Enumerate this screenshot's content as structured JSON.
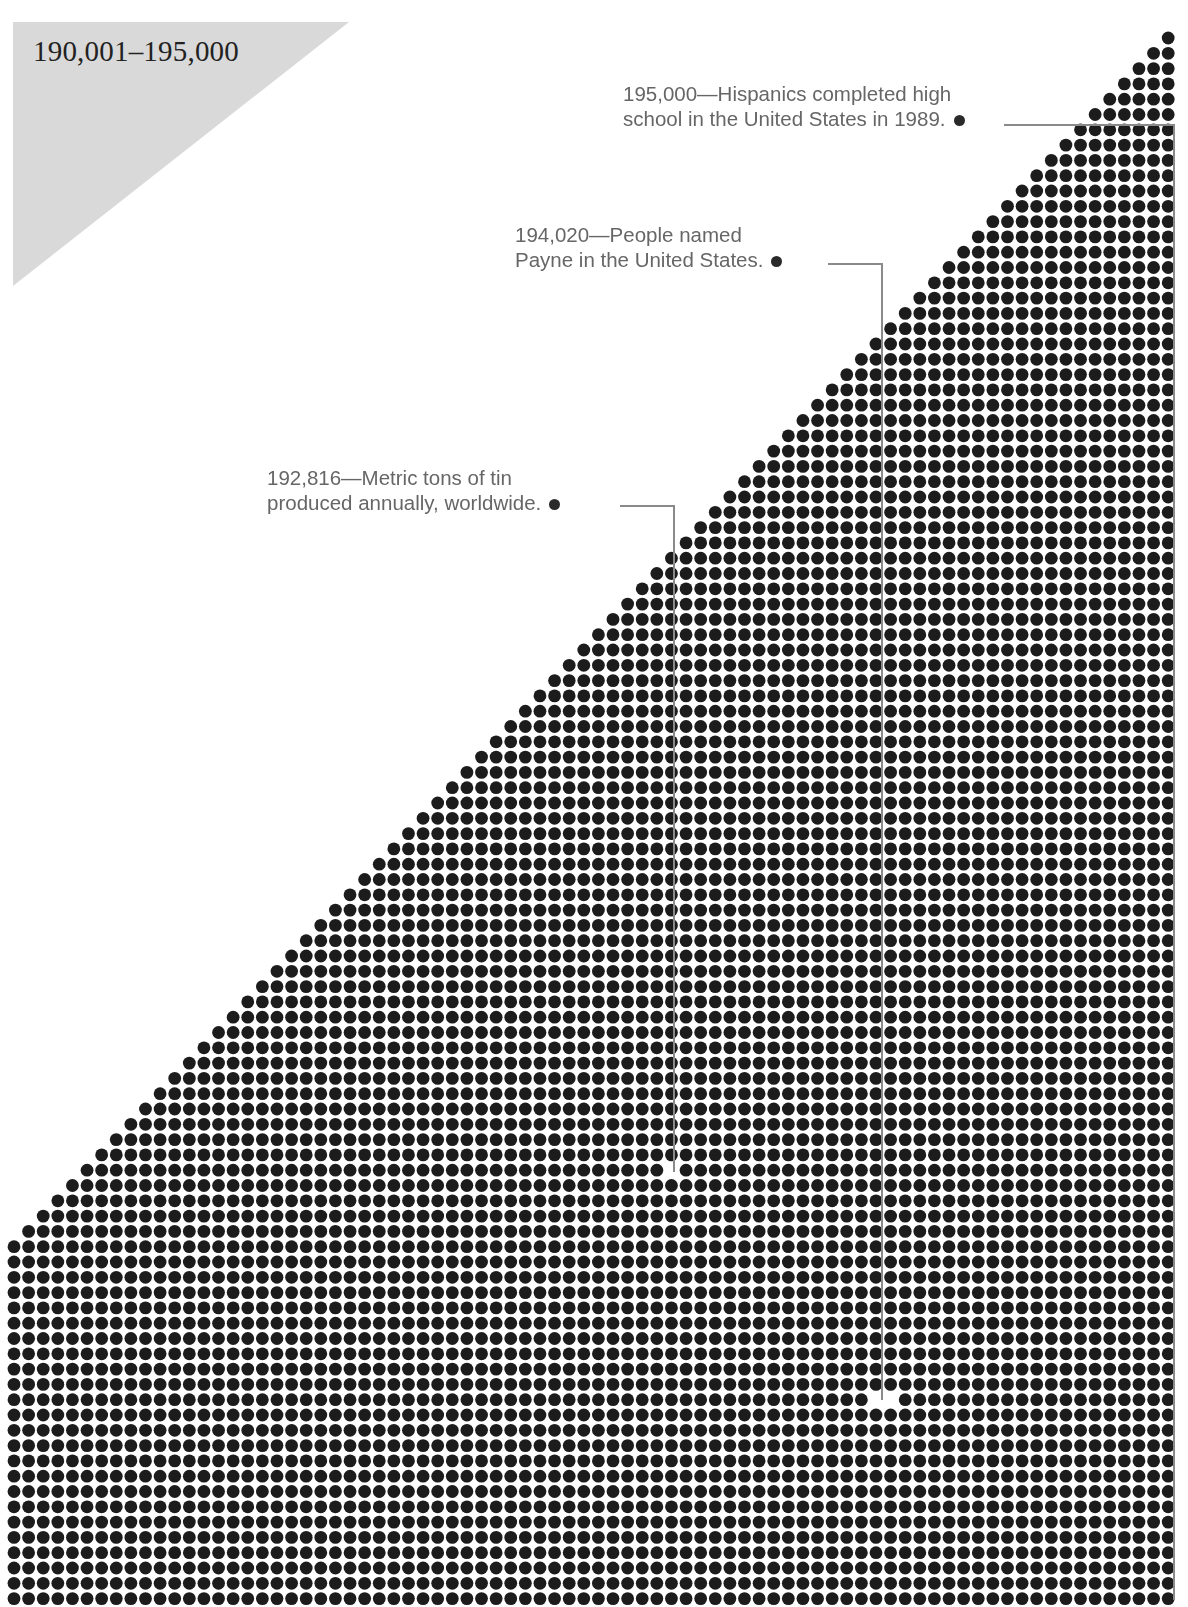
{
  "header": {
    "range_label": "190,001–195,000",
    "triangle_color": "#d9d9d9"
  },
  "callouts": [
    {
      "value": "195,000",
      "line1": "195,000—Hispanics completed high",
      "line2": "school in the United States in 1989.",
      "text_x": 623,
      "text_y": 81,
      "bullet": [
        992,
        125
      ],
      "leader": [
        [
          1004,
          125
        ],
        [
          1174,
          125
        ],
        [
          1174,
          1600
        ]
      ]
    },
    {
      "value": "194,020",
      "line1": "194,020—People named",
      "line2": "Payne in the United States.",
      "text_x": 515,
      "text_y": 222,
      "bullet": [
        812,
        264
      ],
      "leader": [
        [
          828,
          264
        ],
        [
          882,
          264
        ],
        [
          882,
          1400
        ]
      ]
    },
    {
      "value": "192,816",
      "line1": "192,816—Metric tons of tin",
      "line2": "produced annually, worldwide.",
      "text_x": 267,
      "text_y": 465,
      "bullet": [
        606,
        506
      ],
      "leader": [
        [
          620,
          506
        ],
        [
          674,
          506
        ],
        [
          674,
          1172
        ]
      ]
    }
  ],
  "dot_grid": {
    "cols": 80,
    "triangle_rows": 80,
    "full_rows": 23,
    "x0": 14,
    "y0": 38,
    "pitch_x": 14.61,
    "pitch_y": 15.3,
    "dot_radius": 6.4,
    "dot_color": "#1c1c1c",
    "line_color": "#8a8a8a",
    "gaps": [
      [
        674,
        1172
      ],
      [
        882,
        1400
      ]
    ]
  },
  "chart_data": {
    "type": "dot-matrix",
    "title": "190,001–195,000",
    "range": [
      190001,
      195000
    ],
    "annotations": [
      {
        "value": 195000,
        "label": "Hispanics completed high school in the United States in 1989."
      },
      {
        "value": 194020,
        "label": "People named Payne in the United States."
      },
      {
        "value": 192816,
        "label": "Metric tons of tin produced annually, worldwide."
      }
    ]
  }
}
